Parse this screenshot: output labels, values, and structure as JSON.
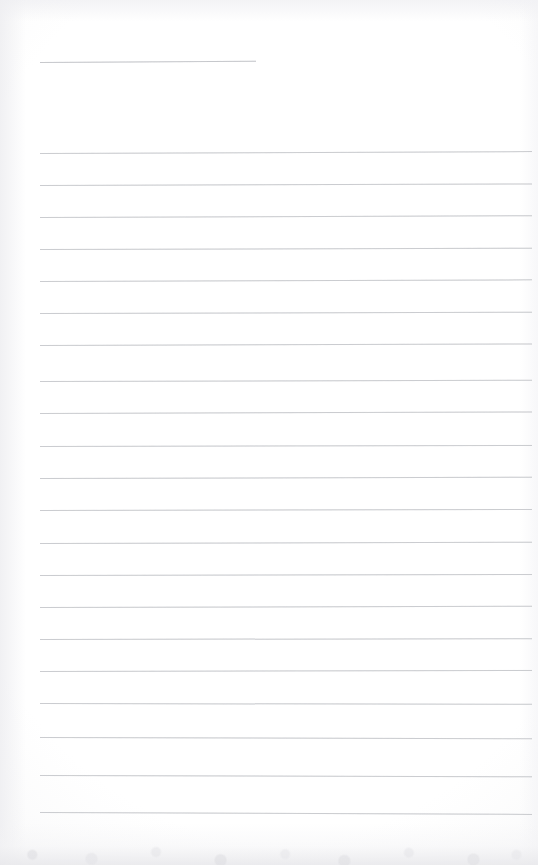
{
  "page": {
    "kind": "scanned-blank-ruled-notebook-page",
    "width": 538,
    "height": 865,
    "paper_color": "#fdfdfd",
    "rule_color": "#c9cace",
    "text_content": "",
    "handwriting_present": "none",
    "printed_text_present": "none"
  },
  "ruling": {
    "left_margin_x": 40,
    "right_end_x": 530,
    "line_spacing_px": 32,
    "stroke_width_px": 1,
    "total_visible_rules": 22,
    "short_rule_count": 1,
    "full_rule_count": 21
  },
  "lines": [
    {
      "id": "rule-header",
      "type": "short",
      "x": 40,
      "y": 62,
      "width": 216,
      "tilt_deg": -0.35
    },
    {
      "id": "rule-01",
      "type": "full",
      "x": 40,
      "y": 153,
      "width": 492,
      "tilt_deg": -0.22
    },
    {
      "id": "rule-02",
      "type": "full",
      "x": 40,
      "y": 185,
      "width": 492,
      "tilt_deg": -0.18
    },
    {
      "id": "rule-03",
      "type": "full",
      "x": 40,
      "y": 217,
      "width": 492,
      "tilt_deg": -0.2
    },
    {
      "id": "rule-04",
      "type": "full",
      "x": 40,
      "y": 249,
      "width": 492,
      "tilt_deg": -0.16
    },
    {
      "id": "rule-05",
      "type": "full",
      "x": 40,
      "y": 281,
      "width": 492,
      "tilt_deg": -0.19
    },
    {
      "id": "rule-06",
      "type": "full",
      "x": 40,
      "y": 313,
      "width": 492,
      "tilt_deg": -0.15
    },
    {
      "id": "rule-07",
      "type": "full",
      "x": 40,
      "y": 345,
      "width": 492,
      "tilt_deg": -0.18
    },
    {
      "id": "rule-08",
      "type": "full",
      "x": 40,
      "y": 381,
      "width": 492,
      "tilt_deg": -0.14
    },
    {
      "id": "rule-09",
      "type": "full",
      "x": 40,
      "y": 413,
      "width": 492,
      "tilt_deg": -0.17
    },
    {
      "id": "rule-10",
      "type": "full",
      "x": 40,
      "y": 446,
      "width": 492,
      "tilt_deg": -0.13
    },
    {
      "id": "rule-11",
      "type": "full",
      "x": 40,
      "y": 478,
      "width": 492,
      "tilt_deg": -0.16
    },
    {
      "id": "rule-12",
      "type": "full",
      "x": 40,
      "y": 510,
      "width": 492,
      "tilt_deg": -0.12
    },
    {
      "id": "rule-13",
      "type": "full",
      "x": 40,
      "y": 543,
      "width": 492,
      "tilt_deg": -0.15
    },
    {
      "id": "rule-14",
      "type": "full",
      "x": 40,
      "y": 575,
      "width": 492,
      "tilt_deg": -0.11
    },
    {
      "id": "rule-15",
      "type": "full",
      "x": 40,
      "y": 607,
      "width": 492,
      "tilt_deg": -0.14
    },
    {
      "id": "rule-16",
      "type": "full",
      "x": 40,
      "y": 639,
      "width": 492,
      "tilt_deg": -0.1
    },
    {
      "id": "rule-17",
      "type": "full",
      "x": 40,
      "y": 671,
      "width": 492,
      "tilt_deg": -0.13
    },
    {
      "id": "rule-18",
      "type": "full",
      "x": 40,
      "y": 703,
      "width": 492,
      "tilt_deg": 0.1
    },
    {
      "id": "rule-19",
      "type": "full",
      "x": 40,
      "y": 737,
      "width": 492,
      "tilt_deg": 0.14
    },
    {
      "id": "rule-20",
      "type": "full",
      "x": 40,
      "y": 775,
      "width": 492,
      "tilt_deg": 0.16
    },
    {
      "id": "rule-21",
      "type": "full",
      "x": 40,
      "y": 812,
      "width": 492,
      "tilt_deg": 0.22
    }
  ]
}
